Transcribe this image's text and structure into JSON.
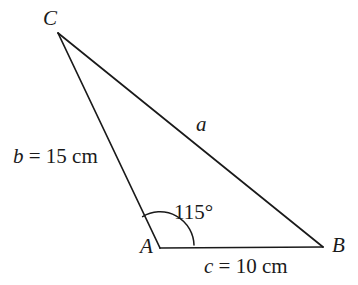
{
  "figure": {
    "background_color": "#ffffff",
    "stroke_color": "#1a1a1a",
    "stroke_width": 1.7
  },
  "vertices": {
    "A": {
      "label": "A",
      "x": 160,
      "y": 248
    },
    "B": {
      "label": "B",
      "x": 323,
      "y": 247
    },
    "C": {
      "label": "C",
      "x": 58,
      "y": 33
    }
  },
  "sides": [
    {
      "name": "a",
      "label": "a",
      "from": "B",
      "to": "C",
      "annotation": "a"
    },
    {
      "name": "b",
      "label": "b = 15 cm",
      "from": "C",
      "to": "A",
      "variable": "b",
      "equals": "=",
      "value": "15",
      "unit": "cm"
    },
    {
      "name": "c",
      "label": "c = 10 cm",
      "from": "A",
      "to": "B",
      "variable": "c",
      "equals": "=",
      "value": "10",
      "unit": "cm"
    }
  ],
  "angle": {
    "at_vertex": "A",
    "label": "115°",
    "value": "115",
    "unit": "°",
    "radius": 34,
    "arc_path": "M 194 245 A 34 34 0 0 0 142.6 216.6"
  },
  "geometry_paths": {
    "side_b_ca": "M 58 33 L 160 248",
    "side_a_cb": "M 58 33 L 323 247",
    "side_c_ab": "M 160 248 L 323 247"
  }
}
